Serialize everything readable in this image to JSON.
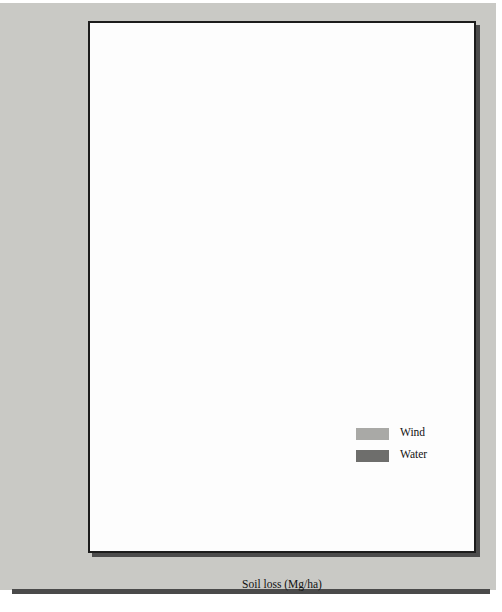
{
  "chart_data": {
    "type": "bar",
    "orientation": "horizontal",
    "title": "",
    "xlabel": "Soil loss (Mg/ha)",
    "ylabel": "",
    "xlim": [
      0,
      30
    ],
    "xticks": [
      0,
      5,
      10,
      15,
      20,
      25,
      30
    ],
    "xtick_labels": [
      "0",
      "5",
      "10",
      "15",
      "20",
      "25",
      "30"
    ],
    "grid": false,
    "legend_position": "center-right",
    "categories": [
      "Texas",
      "Colorado",
      "Montana",
      "New Mexico",
      "Oklahoma",
      "North Dakota",
      "Kansas",
      "South Dakota",
      "Nebraska",
      "Wyoming"
    ],
    "series": [
      {
        "name": "Wind",
        "color": "#a9a9a6",
        "values": [
          20.2,
          22.3,
          13.2,
          30.1,
          3.9,
          4.3,
          4.7,
          5.2,
          3.9,
          21.1
        ]
      },
      {
        "name": "Water",
        "color": "#6e6e6c",
        "values": [
          5.7,
          4.7,
          3.7,
          1.9,
          6.2,
          3.1,
          4.8,
          4.6,
          7.5,
          1.6
        ]
      }
    ]
  },
  "legend": {
    "entries": [
      {
        "label": "Wind"
      },
      {
        "label": "Water"
      }
    ]
  },
  "colors": {
    "page_background": "#c9c9c5",
    "plot_background": "#fdfdfd",
    "frame": "#1c1c1c",
    "wind": "#a9a9a6",
    "water": "#6e6e6c"
  }
}
